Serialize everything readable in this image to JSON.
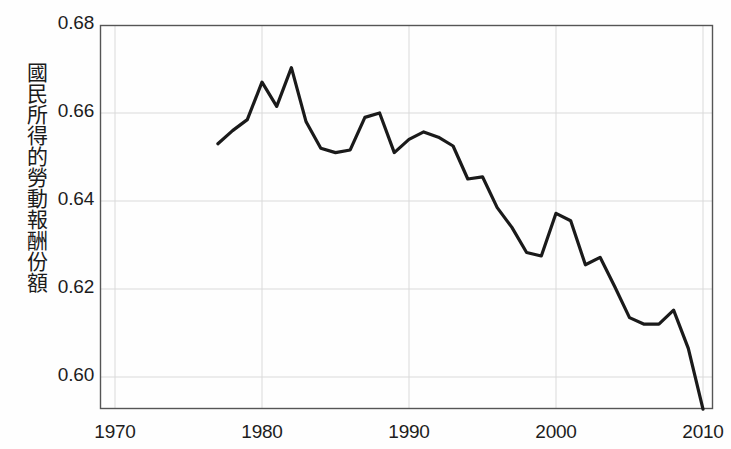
{
  "chart_data": {
    "type": "line",
    "title": "",
    "xlabel": "",
    "ylabel": "國民所得的勞動報酬份額",
    "xlim": [
      1970,
      2010
    ],
    "ylim": [
      0.5927,
      0.68
    ],
    "grid": true,
    "legend": null,
    "xticks": [
      1970,
      1980,
      1990,
      2000,
      2010
    ],
    "xtick_labels": [
      "1970",
      "1980",
      "1990",
      "2000",
      "2010"
    ],
    "yticks": [
      0.6,
      0.62,
      0.64,
      0.66,
      0.68
    ],
    "ytick_labels": [
      "0.60",
      "0.62",
      "0.64",
      "0.66",
      "0.68"
    ],
    "line_color": "#1a1a1a",
    "line_width": 3.2,
    "x": [
      1977,
      1978,
      1979,
      1980,
      1981,
      1982,
      1983,
      1984,
      1985,
      1986,
      1987,
      1988,
      1989,
      1990,
      1991,
      1992,
      1993,
      1994,
      1995,
      1996,
      1997,
      1998,
      1999,
      2000,
      2001,
      2002,
      2003,
      2004,
      2005,
      2006,
      2007,
      2008,
      2009,
      2010
    ],
    "values": [
      0.653,
      0.656,
      0.6585,
      0.667,
      0.6615,
      0.6703,
      0.658,
      0.652,
      0.651,
      0.6516,
      0.659,
      0.66,
      0.651,
      0.654,
      0.6557,
      0.6545,
      0.6525,
      0.645,
      0.6455,
      0.6385,
      0.634,
      0.6283,
      0.6275,
      0.6372,
      0.6355,
      0.6255,
      0.6272,
      0.6205,
      0.6135,
      0.612,
      0.612,
      0.6152,
      0.6065,
      0.5927
    ],
    "series_name": "勞動報酬份額"
  },
  "axis": {
    "ytick_labels": [
      "0.68",
      "0.66",
      "0.64",
      "0.62",
      "0.60"
    ],
    "xtick_labels": [
      "1970",
      "1980",
      "1990",
      "2000",
      "2010"
    ]
  },
  "labels": {
    "y_axis_title": "國民所得的勞動報酬份額"
  }
}
